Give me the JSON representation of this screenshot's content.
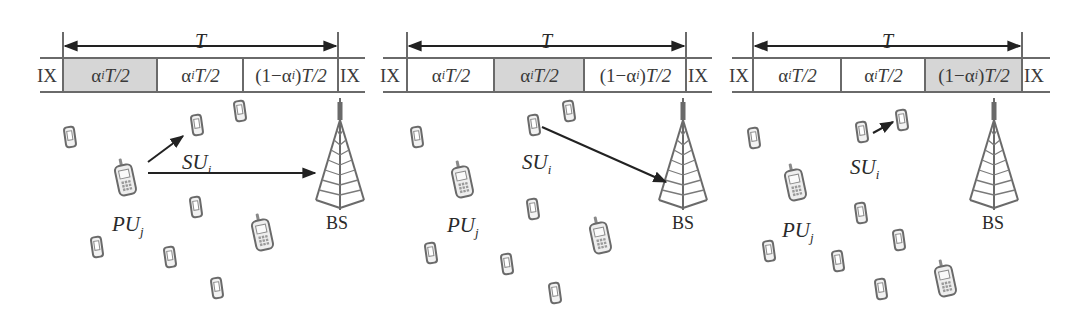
{
  "figure": {
    "panels": [
      {
        "id": "panel-1",
        "frame_label": "T",
        "ix_label": "IX",
        "geometry": {
          "line_x0": 40,
          "line_x1": 365,
          "left": 63,
          "right": 338,
          "dividers": [
            157,
            243
          ]
        },
        "slots": [
          {
            "alpha": "α",
            "sub": "i",
            "rest": "T/2",
            "prefix": "",
            "shaded": true
          },
          {
            "alpha": "α",
            "sub": "i",
            "rest": "T/2",
            "prefix": "",
            "shaded": false
          },
          {
            "alpha": "α",
            "sub": "i",
            "rest": "T/2",
            "prefix": "(1−",
            "suffix": ")",
            "shaded": false
          }
        ],
        "pu_label": "PU",
        "pu_sub": "j",
        "su_label": "SU",
        "su_sub": "i",
        "bs_label": "BS",
        "pu": {
          "x": 125,
          "y": 180
        },
        "su": {
          "x": 197,
          "y": 125
        },
        "bs": {
          "x": 340,
          "y": 160
        },
        "pu_text": {
          "x": 112,
          "y": 212
        },
        "su_text": {
          "x": 182,
          "y": 150
        },
        "bs_text": {
          "x": 326,
          "y": 213
        },
        "arrows": [
          {
            "x1": 148,
            "y1": 162,
            "x2": 183,
            "y2": 136
          },
          {
            "x1": 148,
            "y1": 173,
            "x2": 315,
            "y2": 173
          }
        ],
        "small_phones": [
          [
            70,
            137
          ],
          [
            240,
            111
          ],
          [
            196,
            207
          ],
          [
            97,
            247
          ],
          [
            170,
            257
          ],
          [
            217,
            288
          ]
        ],
        "large_phones": [
          [
            262,
            235
          ]
        ]
      },
      {
        "id": "panel-2",
        "frame_label": "T",
        "ix_label": "IX",
        "geometry": {
          "line_x0": 383,
          "line_x1": 712,
          "left": 407,
          "right": 686,
          "dividers": [
            494,
            584
          ]
        },
        "slots": [
          {
            "alpha": "α",
            "sub": "i",
            "rest": "T/2",
            "prefix": "",
            "shaded": false
          },
          {
            "alpha": "α",
            "sub": "i",
            "rest": "T/2",
            "prefix": "",
            "shaded": true
          },
          {
            "alpha": "α",
            "sub": "i",
            "rest": "T/2",
            "prefix": "(1−",
            "suffix": ")",
            "shaded": false
          }
        ],
        "pu_label": "PU",
        "pu_sub": "j",
        "su_label": "SU",
        "su_sub": "i",
        "bs_label": "BS",
        "pu": {
          "x": 462,
          "y": 182
        },
        "su": {
          "x": 534,
          "y": 125
        },
        "bs": {
          "x": 683,
          "y": 160
        },
        "pu_text": {
          "x": 447,
          "y": 213
        },
        "su_text": {
          "x": 522,
          "y": 150
        },
        "bs_text": {
          "x": 672,
          "y": 213
        },
        "arrows": [
          {
            "x1": 542,
            "y1": 127,
            "x2": 666,
            "y2": 182
          }
        ],
        "small_phones": [
          [
            417,
            137
          ],
          [
            569,
            111
          ],
          [
            533,
            209
          ],
          [
            431,
            253
          ],
          [
            507,
            264
          ],
          [
            555,
            293
          ]
        ],
        "large_phones": [
          [
            600,
            238
          ]
        ]
      },
      {
        "id": "panel-3",
        "frame_label": "T",
        "ix_label": "IX",
        "geometry": {
          "line_x0": 732,
          "line_x1": 1050,
          "left": 753,
          "right": 1022,
          "dividers": [
            841,
            925
          ]
        },
        "slots": [
          {
            "alpha": "α",
            "sub": "i",
            "rest": "T/2",
            "prefix": "",
            "shaded": false
          },
          {
            "alpha": "α",
            "sub": "i",
            "rest": "T/2",
            "prefix": "",
            "shaded": false
          },
          {
            "alpha": "α",
            "sub": "i",
            "rest": "T/2",
            "prefix": "(1−",
            "suffix": ")",
            "shaded": true
          }
        ],
        "pu_label": "PU",
        "pu_sub": "j",
        "su_label": "SU",
        "su_sub": "i",
        "bs_label": "BS",
        "pu": {
          "x": 795,
          "y": 185
        },
        "su": {
          "x": 862,
          "y": 132
        },
        "bs": {
          "x": 994,
          "y": 160
        },
        "pu_text": {
          "x": 782,
          "y": 218
        },
        "su_text": {
          "x": 850,
          "y": 155
        },
        "bs_text": {
          "x": 982,
          "y": 213
        },
        "arrows": [
          {
            "x1": 873,
            "y1": 133,
            "x2": 893,
            "y2": 122
          }
        ],
        "small_phones": [
          [
            754,
            138
          ],
          [
            902,
            120
          ],
          [
            861,
            213
          ],
          [
            769,
            251
          ],
          [
            838,
            261
          ],
          [
            899,
            240
          ],
          [
            881,
            289
          ]
        ],
        "large_phones": [
          [
            945,
            281
          ]
        ]
      }
    ]
  }
}
